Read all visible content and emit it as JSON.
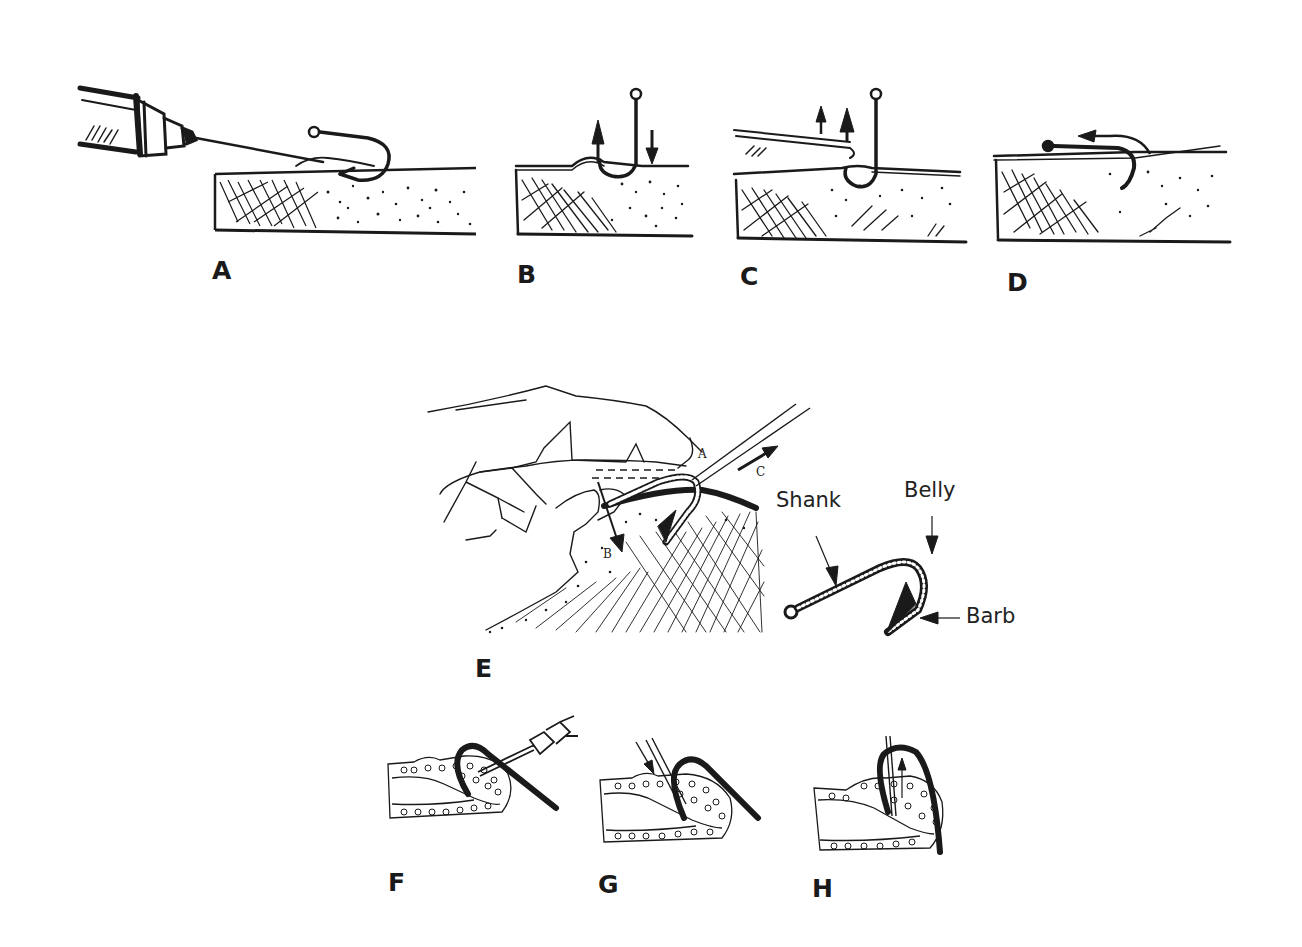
{
  "figure": {
    "panels": [
      {
        "id": "A",
        "label": "A",
        "description": "Syringe injecting local anesthetic near embedded fishhook in skin"
      },
      {
        "id": "B",
        "label": "B",
        "description": "Push-through / retrograde: hook shank pressed down, arrows up and down"
      },
      {
        "id": "C",
        "label": "C",
        "description": "Needle cover technique: needle slid along hook, arrows up"
      },
      {
        "id": "D",
        "label": "D",
        "description": "Hook backed out following curved arrow"
      },
      {
        "id": "E",
        "label": "E",
        "description": "String-yank technique: hand pressing shank, string pulled in direction C"
      },
      {
        "id": "F",
        "label": "F",
        "description": "Fingertip cross-section with hook and syringe"
      },
      {
        "id": "G",
        "label": "G",
        "description": "Fingertip cross-section with needle advanced along hook, arrow down"
      },
      {
        "id": "H",
        "label": "H",
        "description": "Fingertip cross-section with hook being withdrawn, arrow up"
      }
    ],
    "panel_e_markers": {
      "a": "A",
      "b": "B",
      "c": "C"
    },
    "hook_anatomy": {
      "shank": "Shank",
      "belly": "Belly",
      "barb": "Barb"
    }
  },
  "colors": {
    "ink": "#1a1a1a",
    "background": "#ffffff"
  }
}
